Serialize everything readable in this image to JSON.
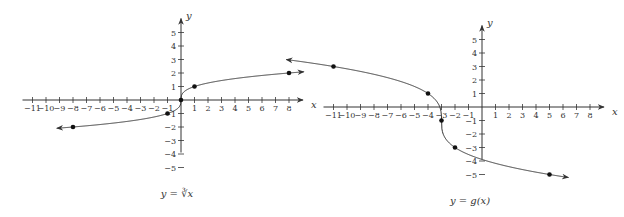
{
  "chart_data": [
    {
      "type": "line",
      "title": "",
      "caption": "y = ∛x",
      "caption_parts": {
        "lhs": "y",
        "eq": " = ",
        "rhs": "∛x"
      },
      "xlabel": "x",
      "ylabel": "y",
      "xlim": [
        -11,
        8
      ],
      "ylim": [
        -5,
        5
      ],
      "x_ticks": [
        -11,
        -10,
        -9,
        -8,
        -7,
        -6,
        -5,
        -4,
        -3,
        -2,
        -1,
        1,
        2,
        3,
        4,
        5,
        6,
        7,
        8
      ],
      "y_ticks": [
        -5,
        -4,
        -3,
        -2,
        -1,
        1,
        2,
        3,
        4,
        5
      ],
      "grid": false,
      "function": "y = cbrt(x)",
      "domain": [
        -9.2,
        9.1
      ],
      "arrows": "both ends",
      "marked_points": [
        [
          -8,
          -2
        ],
        [
          -1,
          -1
        ],
        [
          0,
          0
        ],
        [
          1,
          1
        ],
        [
          8,
          2
        ]
      ],
      "origin_px": [
        181,
        100
      ],
      "unit_px": 13.5
    },
    {
      "type": "line",
      "title": "",
      "caption": "y = g(x)",
      "caption_parts": {
        "lhs": "y",
        "eq": " = ",
        "rhs": "g(x)"
      },
      "xlabel": "x",
      "ylabel": "y",
      "xlim": [
        -11,
        8
      ],
      "ylim": [
        -5,
        5
      ],
      "x_ticks": [
        -11,
        -10,
        -9,
        -8,
        -7,
        -6,
        -5,
        -4,
        -3,
        -2,
        -1,
        1,
        2,
        3,
        4,
        5,
        6,
        7,
        8
      ],
      "y_ticks": [
        -5,
        -4,
        -3,
        -2,
        -1,
        1,
        2,
        3,
        4,
        5
      ],
      "grid": false,
      "function": "g(x) = -2*cbrt(x+3) - 1",
      "domain": [
        -14.5,
        6.4
      ],
      "arrows": "both ends",
      "marked_points": [
        [
          -11,
          3
        ],
        [
          -4,
          1
        ],
        [
          -3,
          -1
        ],
        [
          -2,
          -3
        ],
        [
          5,
          -5
        ]
      ],
      "origin_px": [
        482,
        107
      ],
      "unit_px": 13.5
    }
  ]
}
